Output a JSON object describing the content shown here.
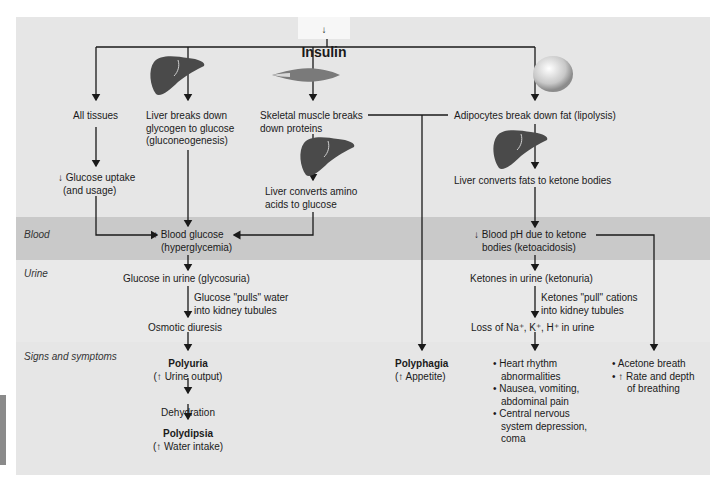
{
  "title": {
    "arrow": "↓",
    "label": "Insulin"
  },
  "row_labels": {
    "blood": "Blood",
    "urine": "Urine",
    "signs": "Signs and symptoms"
  },
  "icons": {
    "liver": "liver-icon",
    "muscle": "skeletal-muscle-icon",
    "adipocyte": "adipocyte-icon"
  },
  "nodes": {
    "all_tissues": "All tissues",
    "glucose_uptake_1": "↓ Glucose uptake",
    "glucose_uptake_2": "(and usage)",
    "liver_glycogen_1": "Liver breaks down",
    "liver_glycogen_2": "glycogen to glucose",
    "liver_glycogen_3": "(gluconeogenesis)",
    "muscle_1": "Skeletal muscle breaks",
    "muscle_2": "down proteins",
    "liver_amino_1": "Liver converts amino",
    "liver_amino_2": "acids to glucose",
    "adipocytes": "Adipocytes break down fat (lipolysis)",
    "liver_fats": "Liver converts fats to ketone bodies",
    "blood_glucose_1": "↑ Blood glucose",
    "blood_glucose_2": "(hyperglycemia)",
    "blood_ph_1": "↓ Blood pH due to ketone",
    "blood_ph_2": "bodies (ketoacidosis)",
    "glycosuria": "Glucose in urine (glycosuria)",
    "glucose_pulls_1": "Glucose \"pulls\" water",
    "glucose_pulls_2": "into kidney tubules",
    "osmotic": "Osmotic diuresis",
    "ketonuria": "Ketones in urine (ketonuria)",
    "ketones_pull_1": "Ketones \"pull\" cations",
    "ketones_pull_2": "into kidney tubules",
    "loss_ions": "Loss of Na⁺, K⁺, H⁺ in urine",
    "polyuria": "Polyuria",
    "polyuria_sub": "(↑ Urine output)",
    "dehydration": "Dehydration",
    "polydipsia": "Polydipsia",
    "polydipsia_sub": "(↑ Water intake)",
    "polyphagia": "Polyphagia",
    "polyphagia_sub": "(↑ Appetite)",
    "ketone_symptoms": [
      "• Heart rhythm",
      "abnormalities",
      "• Nausea, vomiting,",
      "abdominal pain",
      "• Central nervous",
      "system depression,",
      "coma"
    ],
    "breath_symptoms": [
      "• Acetone breath",
      "• ↑ Rate and depth",
      "of breathing"
    ]
  },
  "colors": {
    "band_light": "#e6e6e6",
    "band_blood": "#c9c9c9",
    "line": "#1a1a1a"
  }
}
